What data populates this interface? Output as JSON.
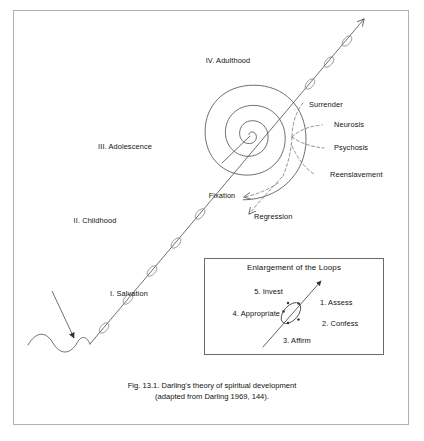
{
  "figure": {
    "caption_line1": "Fig. 13.1. Darling's theory of spiritual development",
    "caption_line2": "(adapted from Darling 1969, 144)."
  },
  "stages": [
    {
      "id": "salvation",
      "label": "I. Salvation"
    },
    {
      "id": "childhood",
      "label": "II. Childhood"
    },
    {
      "id": "adolescence",
      "label": "III. Adolescence"
    },
    {
      "id": "adulthood",
      "label": "IV. Adulthood"
    }
  ],
  "outcomes": [
    {
      "id": "surrender",
      "label": "Surrender"
    },
    {
      "id": "neurosis",
      "label": "Neurosis"
    },
    {
      "id": "psychosis",
      "label": "Psychosis"
    },
    {
      "id": "reenslavement",
      "label": "Reenslavement"
    }
  ],
  "deviations": [
    {
      "id": "fixation",
      "label": "Fixation"
    },
    {
      "id": "regression",
      "label": "Regression"
    }
  ],
  "inset": {
    "title": "Enlargement of the Loops",
    "steps": [
      {
        "id": "assess",
        "label": "1. Assess"
      },
      {
        "id": "confess",
        "label": "2. Confess"
      },
      {
        "id": "affirm",
        "label": "3. Affirm"
      },
      {
        "id": "appropriate",
        "label": "4. Appropriate"
      },
      {
        "id": "invest",
        "label": "5. Invest"
      }
    ]
  },
  "colors": {
    "ink": "#333333",
    "text": "#111111",
    "frame": "#b0b0b0",
    "inset_frame": "#6a6a6a",
    "background": "#ffffff"
  }
}
